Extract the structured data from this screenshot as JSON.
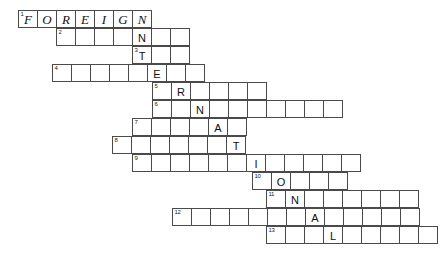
{
  "puzzle": {
    "type": "acrostic-staircase-crossword",
    "title_word": "FOREIGN",
    "hidden_word": "INTERNATIONAL",
    "cell_width": 20,
    "cell_height": 18,
    "grid_origin": {
      "x": 18,
      "y": 10
    },
    "rows": [
      {
        "number": "1",
        "x": 18,
        "y": 10,
        "length": 7,
        "seed_row": true,
        "letters": [
          "F",
          "O",
          "R",
          "E",
          "I",
          "G",
          "N"
        ],
        "filled_index": null
      },
      {
        "number": "2",
        "x": 56,
        "y": 28,
        "length": 7,
        "seed_row": false,
        "letters": [
          "",
          "",
          "",
          "",
          "N",
          "",
          ""
        ],
        "filled_index": 4,
        "filled_letter": "N"
      },
      {
        "number": "3",
        "x": 132,
        "y": 46,
        "length": 3,
        "seed_row": false,
        "letters": [
          "T",
          "",
          ""
        ],
        "filled_index": 0,
        "filled_letter": "T"
      },
      {
        "number": "4",
        "x": 52,
        "y": 64,
        "length": 8,
        "seed_row": false,
        "letters": [
          "",
          "",
          "",
          "",
          "",
          "E",
          "",
          ""
        ],
        "filled_index": 5,
        "filled_letter": "E"
      },
      {
        "number": "5",
        "x": 152,
        "y": 82,
        "length": 6,
        "seed_row": false,
        "letters": [
          "",
          "R",
          "",
          "",
          "",
          ""
        ],
        "filled_index": 1,
        "filled_letter": "R"
      },
      {
        "number": "6",
        "x": 152,
        "y": 100,
        "length": 10,
        "seed_row": false,
        "letters": [
          "",
          "",
          "N",
          "",
          "",
          "",
          "",
          "",
          "",
          ""
        ],
        "filled_index": 2,
        "filled_letter": "N"
      },
      {
        "number": "7",
        "x": 132,
        "y": 118,
        "length": 6,
        "seed_row": false,
        "letters": [
          "",
          "",
          "",
          "",
          "A",
          ""
        ],
        "filled_index": 4,
        "filled_letter": "A"
      },
      {
        "number": "8",
        "x": 112,
        "y": 136,
        "length": 7,
        "seed_row": false,
        "letters": [
          "",
          "",
          "",
          "",
          "",
          "",
          "T"
        ],
        "filled_index": 6,
        "filled_letter": "T"
      },
      {
        "number": "9",
        "x": 132,
        "y": 154,
        "length": 12,
        "seed_row": false,
        "letters": [
          "",
          "",
          "",
          "",
          "",
          "",
          "I",
          "",
          "",
          "",
          "",
          ""
        ],
        "filled_index": 6,
        "filled_letter": "I"
      },
      {
        "number": "10",
        "x": 252,
        "y": 172,
        "length": 5,
        "seed_row": false,
        "letters": [
          "",
          "O",
          "",
          "",
          ""
        ],
        "filled_index": 1,
        "filled_letter": "O"
      },
      {
        "number": "11",
        "x": 266,
        "y": 190,
        "length": 8,
        "seed_row": false,
        "letters": [
          "",
          "N",
          "",
          "",
          "",
          "",
          "",
          ""
        ],
        "filled_index": 1,
        "filled_letter": "N"
      },
      {
        "number": "12",
        "x": 172,
        "y": 208,
        "length": 13,
        "seed_row": false,
        "letters": [
          "",
          "",
          "",
          "",
          "",
          "",
          "",
          "A",
          "",
          "",
          "",
          "",
          ""
        ],
        "filled_index": 7,
        "filled_letter": "A"
      },
      {
        "number": "13",
        "x": 266,
        "y": 226,
        "length": 9,
        "seed_row": false,
        "letters": [
          "",
          "",
          "",
          "L",
          "",
          "",
          "",
          "",
          ""
        ],
        "filled_index": 3,
        "filled_letter": "L"
      }
    ],
    "colors": {
      "grid_line": "#4a4a4a",
      "grid_line_bold": "#2b2b2b",
      "letter": "#111111",
      "number": "#1a1a1a",
      "background": "#ffffff"
    }
  }
}
